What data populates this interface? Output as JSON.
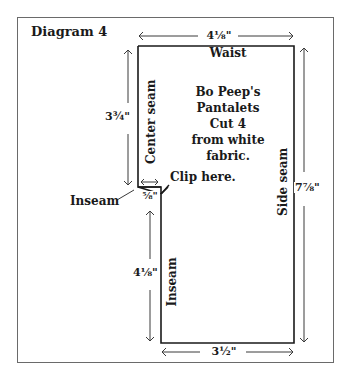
{
  "diagram": {
    "title": "Diagram 4",
    "pattern_piece": {
      "name_lines": [
        "Bo Peep's",
        "Pantalets",
        "Cut 4",
        "from white",
        "fabric."
      ]
    },
    "edge_labels": {
      "top": "Waist",
      "left_upper": "Center seam",
      "left_lower": "Inseam",
      "right": "Side seam",
      "inseam_pointer": "Inseam",
      "clip_note": "Clip here."
    },
    "dimensions": {
      "top_width": "4⅛\"",
      "bottom_width": "3½\"",
      "right_height": "7⅞\"",
      "left_upper_height": "3¾\"",
      "left_lower_height": "4⅛\"",
      "notch_width": "⅝\""
    },
    "colors": {
      "outline": "#1a1a1a",
      "arrow": "#3a3a3a",
      "frame": "#6a6a6a"
    }
  }
}
